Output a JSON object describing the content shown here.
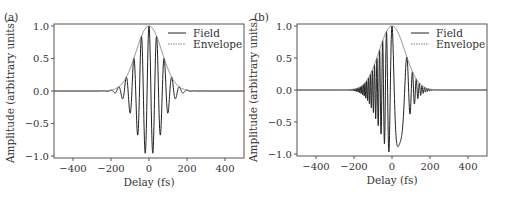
{
  "chart_data": [
    {
      "type": "line",
      "panel_label": "(a)",
      "xlabel": "Delay (fs)",
      "ylabel": "Amplitude (arbitrary units)",
      "xlim": [
        -500,
        500
      ],
      "ylim": [
        -1.0,
        1.0
      ],
      "xticks": [
        -400,
        -200,
        0,
        200,
        400
      ],
      "yticks": [
        -1.0,
        -0.5,
        0.0,
        0.5,
        1.0
      ],
      "xtick_labels": [
        "−400",
        "−200",
        "0",
        "200",
        "400"
      ],
      "ytick_labels": [
        "−1.0",
        "−0.5",
        "0.0",
        "0.5",
        "1.0"
      ],
      "legend": [
        "Field",
        "Envelope"
      ],
      "legend_position": "upper right",
      "series": [
        {
          "name": "Field",
          "description": "Gaussian-enveloped carrier, unchirped",
          "envelope_fwhm_fs": 160,
          "carrier_period_fs": 40,
          "chirp": 0
        },
        {
          "name": "Envelope",
          "description": "Gaussian envelope peak 1.0 at 0 fs"
        }
      ]
    },
    {
      "type": "line",
      "panel_label": "(b)",
      "xlabel": "Delay (fs)",
      "ylabel": "Amplitude (arbitrary units)",
      "xlim": [
        -500,
        500
      ],
      "ylim": [
        -1.0,
        1.0
      ],
      "xticks": [
        -400,
        -200,
        0,
        200,
        400
      ],
      "yticks": [
        -1.0,
        -0.5,
        0.0,
        0.5,
        1.0
      ],
      "xtick_labels": [
        "−400",
        "−200",
        "0",
        "200",
        "400"
      ],
      "ytick_labels": [
        "−1.0",
        "−0.5",
        "0.0",
        "0.5",
        "1.0"
      ],
      "legend": [
        "Field",
        "Envelope"
      ],
      "legend_position": "upper right",
      "series": [
        {
          "name": "Field",
          "description": "Gaussian-enveloped carrier, chirped (period longer at positive delay)",
          "envelope_fwhm_fs": 160,
          "carrier_period_fs": 40,
          "chirp": 0.004
        },
        {
          "name": "Envelope",
          "description": "Gaussian envelope peak 1.0 at 0 fs"
        }
      ]
    }
  ]
}
